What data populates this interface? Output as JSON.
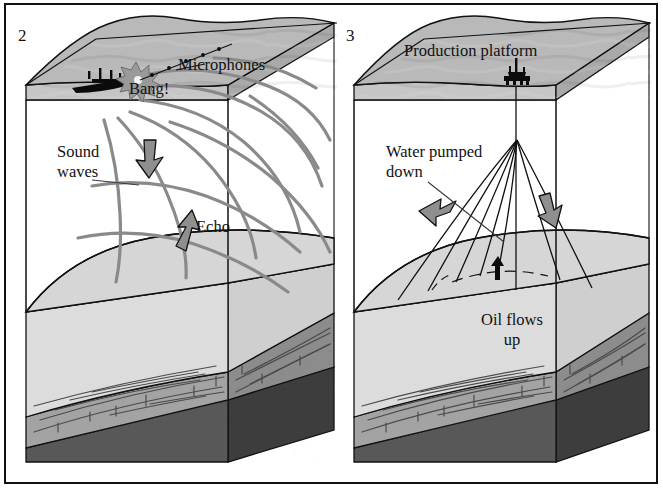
{
  "figure": {
    "kind": "cutaway-block-diagram",
    "border_color": "#111111",
    "background": "#ffffff"
  },
  "palette": {
    "water_top": "#b9b9b9",
    "water_side_light": "#c6c6c6",
    "water_side_dark": "#a9a9a9",
    "seabed_light": "#d6d6d6",
    "oil_black": "#080808",
    "rock_pale": "#dcdcdc",
    "rock_mid": "#a3a3a3",
    "rock_mid_dark": "#8c8c8c",
    "basement_dark": "#585858",
    "basement_darker": "#3d3d3d",
    "wave_gray": "#8a8a8a",
    "arrow_gray": "#8f8f8f",
    "outline": "#111111",
    "leader": "#3a3a3a"
  },
  "panels": [
    {
      "id": "panel-2",
      "number": "2",
      "caption_topic": "seismic survey",
      "labels": [
        {
          "name": "microphones",
          "text": "Microphones",
          "x": 178,
          "y": 70,
          "anchor": "start"
        },
        {
          "name": "bang",
          "text": "Bang!",
          "x": 129,
          "y": 94,
          "anchor": "start"
        },
        {
          "name": "sound-waves-line1",
          "text": "Sound",
          "x": 57,
          "y": 157,
          "anchor": "start"
        },
        {
          "name": "sound-waves-line2",
          "text": "waves",
          "x": 57,
          "y": 177,
          "anchor": "start"
        },
        {
          "name": "echo",
          "text": "Echo",
          "x": 196,
          "y": 232,
          "anchor": "start"
        }
      ],
      "icons": [
        {
          "name": "survey-ship-icon",
          "x": 96,
          "y": 82
        },
        {
          "name": "explosion-burst-icon",
          "x": 136,
          "y": 78
        },
        {
          "name": "microphone-cable-icon",
          "x": 150,
          "y": 70
        }
      ],
      "arrows": [
        {
          "name": "downward-sound-arrow",
          "direction": "down"
        },
        {
          "name": "upward-echo-arrow",
          "direction": "up"
        }
      ],
      "wave_count": 11
    },
    {
      "id": "panel-3",
      "number": "3",
      "caption_topic": "production",
      "labels": [
        {
          "name": "production-platform",
          "text": "Production platform",
          "x": 404,
          "y": 56,
          "anchor": "start"
        },
        {
          "name": "water-pumped-line1",
          "text": "Water pumped",
          "x": 386,
          "y": 157,
          "anchor": "start"
        },
        {
          "name": "water-pumped-line2",
          "text": "down",
          "x": 386,
          "y": 177,
          "anchor": "start"
        },
        {
          "name": "oil-flows-line1",
          "text": "Oil flows",
          "x": 512,
          "y": 325,
          "anchor": "middle"
        },
        {
          "name": "oil-flows-line2",
          "text": "up",
          "x": 512,
          "y": 345,
          "anchor": "middle"
        }
      ],
      "icons": [
        {
          "name": "oil-platform-icon",
          "x": 516,
          "y": 78
        },
        {
          "name": "oil-rising-arrow-icon",
          "x": 497,
          "y": 268
        }
      ],
      "arrows": [
        {
          "name": "water-down-arrow-left",
          "direction": "down-left"
        },
        {
          "name": "water-down-arrow-right",
          "direction": "down-right"
        }
      ],
      "well_bore_count": 8
    }
  ],
  "strata_legend": [
    {
      "name": "sea-water",
      "color": "#b9b9b9"
    },
    {
      "name": "seabed-cap-rock",
      "color": "#d6d6d6"
    },
    {
      "name": "oil-reservoir",
      "color": "#080808"
    },
    {
      "name": "porous-rock",
      "color": "#dcdcdc"
    },
    {
      "name": "layered-sedimentary-rock",
      "color": "#a3a3a3"
    },
    {
      "name": "basement-rock",
      "color": "#585858"
    }
  ]
}
